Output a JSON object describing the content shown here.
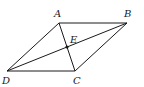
{
  "diagram": {
    "type": "geometry",
    "shape": "parallelogram",
    "points": {
      "A": {
        "label": "A"
      },
      "B": {
        "label": "B"
      },
      "C": {
        "label": "C"
      },
      "D": {
        "label": "D"
      },
      "E": {
        "label": "E"
      }
    },
    "segments": [
      {
        "from": "A",
        "to": "B"
      },
      {
        "from": "B",
        "to": "C"
      },
      {
        "from": "C",
        "to": "D"
      },
      {
        "from": "D",
        "to": "A"
      },
      {
        "from": "A",
        "to": "C"
      },
      {
        "from": "D",
        "to": "B"
      }
    ],
    "intersection": {
      "point": "E",
      "of": [
        "AC",
        "DB"
      ]
    },
    "line_color": "#1a1a1a"
  }
}
